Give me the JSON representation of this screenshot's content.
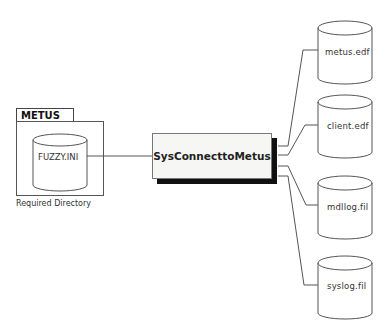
{
  "diagram": {
    "container": {
      "title": "METUS",
      "file": "FUZZY.INI",
      "caption": "Required Directory"
    },
    "process": {
      "label": "SysConnecttoMetus"
    },
    "outputs": [
      {
        "label": "metus.edf"
      },
      {
        "label": "client.edf"
      },
      {
        "label": "mdllog.fil"
      },
      {
        "label": "syslog.fil"
      }
    ],
    "colors": {
      "line": "#555555",
      "shadow": "#111111",
      "box_fill": "#f6f6f4"
    }
  }
}
